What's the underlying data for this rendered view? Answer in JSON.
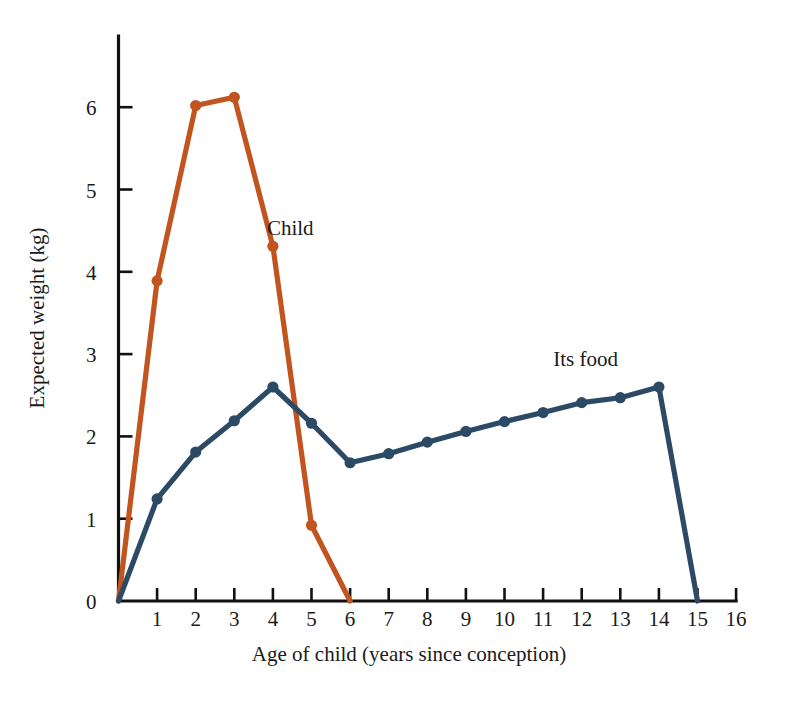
{
  "chart_data": {
    "type": "line",
    "title": "",
    "xlabel": "Age of child (years since conception)",
    "ylabel": "Expected weight (kg)",
    "xlim": [
      0,
      16
    ],
    "ylim": [
      0,
      6.8
    ],
    "xticks": [
      0,
      1,
      2,
      3,
      4,
      5,
      6,
      7,
      8,
      9,
      10,
      11,
      12,
      13,
      14,
      15,
      16
    ],
    "xtick_labels": [
      "0",
      "1",
      "2",
      "3",
      "4",
      "5",
      "6",
      "7",
      "8",
      "9",
      "10",
      "11",
      "12",
      "13",
      "14",
      "15",
      "16"
    ],
    "yticks": [
      0,
      1,
      2,
      3,
      4,
      5,
      6
    ],
    "ytick_labels": [
      "0",
      "1",
      "2",
      "3",
      "4",
      "5",
      "6"
    ],
    "grid": false,
    "legend_position": "inline-annotation",
    "series": [
      {
        "name": "Child",
        "color": "#C1541F",
        "annotation": "Child",
        "annotation_x": 4.45,
        "annotation_y": 4.45,
        "markers": true,
        "x": [
          0,
          1,
          2,
          3,
          4,
          5,
          6
        ],
        "values": [
          0,
          3.89,
          6.02,
          6.12,
          4.31,
          0.92,
          0
        ]
      },
      {
        "name": "Its food",
        "color": "#2C4A65",
        "annotation": "Its food",
        "annotation_x": 12.1,
        "annotation_y": 2.85,
        "markers": true,
        "x": [
          0,
          1,
          2,
          3,
          4,
          5,
          6,
          7,
          8,
          9,
          10,
          11,
          12,
          13,
          14,
          15
        ],
        "values": [
          0,
          1.24,
          1.81,
          2.19,
          2.6,
          2.16,
          1.68,
          1.79,
          1.93,
          2.06,
          2.18,
          2.29,
          2.41,
          2.47,
          2.6,
          0
        ]
      }
    ]
  },
  "colors": {
    "child": "#C1541F",
    "its_food": "#2C4A65",
    "axis": "#111111",
    "background": "#ffffff"
  }
}
